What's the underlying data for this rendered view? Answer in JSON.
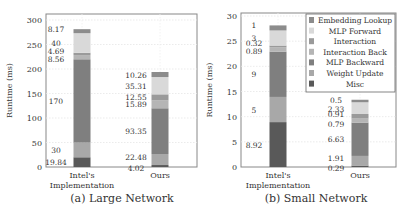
{
  "legend": {
    "items": [
      {
        "label": "Embedding Lookup",
        "color": "#8c8c8c"
      },
      {
        "label": "MLP Forward",
        "color": "#d9d9d9"
      },
      {
        "label": "Interaction",
        "color": "#9a9a9a"
      },
      {
        "label": "Interaction Back",
        "color": "#b5b5b5"
      },
      {
        "label": "MLP Backward",
        "color": "#7f7f7f"
      },
      {
        "label": "Weight Update",
        "color": "#a8a8a8"
      },
      {
        "label": "Misc",
        "color": "#595959"
      }
    ]
  },
  "captions": {
    "left": "(a) Large Network",
    "right": "(b) Small Network"
  },
  "chart_data": [
    {
      "type": "bar",
      "stacked": true,
      "title": "(a) Large Network",
      "xlabel": "",
      "ylabel": "Runtime (ms)",
      "ylim": [
        0,
        300
      ],
      "yticks": [
        0,
        50,
        100,
        150,
        200,
        250,
        300
      ],
      "grid": true,
      "categories": [
        "Intel's Implementation",
        "Ours"
      ],
      "series": [
        {
          "name": "Misc",
          "values": [
            19.84,
            4.02
          ]
        },
        {
          "name": "Weight Update",
          "values": [
            30,
            22.48
          ]
        },
        {
          "name": "MLP Backward",
          "values": [
            170,
            93.35
          ]
        },
        {
          "name": "Interaction Back",
          "values": [
            8.56,
            15.89
          ]
        },
        {
          "name": "Interaction",
          "values": [
            4.69,
            12.55
          ]
        },
        {
          "name": "MLP Forward",
          "values": [
            40,
            35.31
          ]
        },
        {
          "name": "Embedding Lookup",
          "values": [
            8.17,
            10.26
          ]
        }
      ]
    },
    {
      "type": "bar",
      "stacked": true,
      "title": "(b) Small Network",
      "xlabel": "",
      "ylabel": "Runtime (ms)",
      "ylim": [
        0,
        30
      ],
      "yticks": [
        0,
        5,
        10,
        15,
        20,
        25,
        30
      ],
      "grid": true,
      "legend_position": "upper right",
      "categories": [
        "Intel's Implementation",
        "Ours"
      ],
      "series": [
        {
          "name": "Misc",
          "values": [
            8.92,
            0.29
          ]
        },
        {
          "name": "Weight Update",
          "values": [
            5,
            1.91
          ]
        },
        {
          "name": "MLP Backward",
          "values": [
            9,
            6.63
          ]
        },
        {
          "name": "Interaction Back",
          "values": [
            0.89,
            0.79
          ]
        },
        {
          "name": "Interaction",
          "values": [
            0.32,
            0.91
          ]
        },
        {
          "name": "MLP Forward",
          "values": [
            3,
            2.33
          ]
        },
        {
          "name": "Embedding Lookup",
          "values": [
            1,
            0.5
          ]
        }
      ]
    }
  ]
}
